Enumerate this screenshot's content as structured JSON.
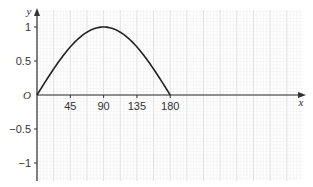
{
  "chart_data": {
    "type": "line",
    "title": "",
    "xlabel": "x",
    "ylabel": "y",
    "origin_label": "O",
    "function": "y = sin(x), 0 ≤ x ≤ 180 (degrees)",
    "xlim": [
      0,
      360
    ],
    "ylim": [
      -1.2,
      1.2
    ],
    "x_ticks": [
      45,
      90,
      135,
      180
    ],
    "x_tick_labels": [
      "45",
      "90",
      "135",
      "180"
    ],
    "y_ticks": [
      1,
      0.5,
      -0.5,
      -1
    ],
    "y_tick_labels": [
      "1",
      "0.5",
      "−0.5",
      "−1"
    ],
    "grid": true,
    "legend": null,
    "series": [
      {
        "name": "sin x",
        "x": [
          0,
          15,
          30,
          45,
          60,
          75,
          90,
          105,
          120,
          135,
          150,
          165,
          180
        ],
        "y": [
          0,
          0.259,
          0.5,
          0.707,
          0.866,
          0.966,
          1,
          0.966,
          0.866,
          0.707,
          0.5,
          0.259,
          0
        ]
      }
    ],
    "colors": {
      "curve": "#222222",
      "axes": "#333333",
      "grid_major": "#d6d6d6",
      "grid_minor": "#ececec"
    }
  }
}
